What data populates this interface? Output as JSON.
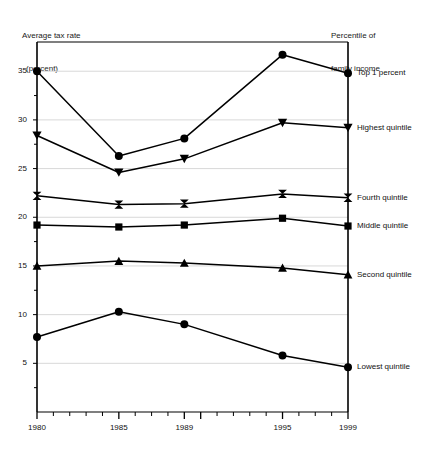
{
  "chart_data": {
    "type": "line",
    "title": "",
    "ylabel": "Average tax rate\n(percent)",
    "ylabel_line1": "Average tax rate",
    "ylabel_line2": "(percent)",
    "legend_title_line1": "Percentile of",
    "legend_title_line2": "family income",
    "legend_position": "right-inline",
    "xlabel": "",
    "grid": true,
    "x": [
      1980,
      1985,
      1989,
      1995,
      1999
    ],
    "xlim": [
      1980,
      1999
    ],
    "ylim": [
      0,
      38
    ],
    "ytick_labels": [
      "5",
      "10",
      "15",
      "20",
      "25",
      "30",
      "35"
    ],
    "ytick_values": [
      5,
      10,
      15,
      20,
      25,
      30,
      35
    ],
    "yminor_values": [
      2.5,
      7.5,
      12.5,
      17.5,
      22.5,
      27.5,
      32.5
    ],
    "xtick_labels": [
      "1980",
      "1985",
      "1989",
      "1995",
      "1999"
    ],
    "xtick_values": [
      1980,
      1985,
      1989,
      1995,
      1999
    ],
    "xtick_all": [
      1980,
      1981,
      1982,
      1983,
      1984,
      1985,
      1986,
      1987,
      1988,
      1989,
      1990,
      1991,
      1992,
      1993,
      1994,
      1995,
      1996,
      1997,
      1998,
      1999
    ],
    "series": [
      {
        "name": "Top 1 percent",
        "marker": "circle",
        "values": [
          35.0,
          26.3,
          28.1,
          36.7,
          34.8
        ]
      },
      {
        "name": "Highest quintile",
        "marker": "triangle-down",
        "values": [
          28.4,
          24.6,
          26.0,
          29.7,
          29.2
        ]
      },
      {
        "name": "Fourth quintile",
        "marker": "bowtie",
        "values": [
          22.2,
          21.3,
          21.4,
          22.4,
          22.0
        ]
      },
      {
        "name": "Middle quintile",
        "marker": "square",
        "values": [
          19.2,
          19.0,
          19.2,
          19.9,
          19.1
        ]
      },
      {
        "name": "Second quintile",
        "marker": "triangle-up",
        "values": [
          15.0,
          15.5,
          15.3,
          14.8,
          14.1
        ]
      },
      {
        "name": "Lowest quintile",
        "marker": "circle",
        "values": [
          7.7,
          10.3,
          9.0,
          5.8,
          4.6
        ]
      }
    ],
    "colors": {
      "line": "#000000",
      "marker": "#000000",
      "grid": "#d8d8d8",
      "axis": "#000000",
      "background": "#ffffff",
      "text": "#111111"
    }
  }
}
